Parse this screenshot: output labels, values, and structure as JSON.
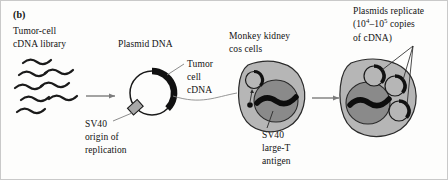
{
  "figure": {
    "panel_letter": "(b)",
    "background_color": "#fdfdfc",
    "border_color": "#c9c9c9",
    "ink_color": "#121212"
  },
  "labels": {
    "cdna_library_line1": "Tumor-cell",
    "cdna_library_line2": "cDNA library",
    "plasmid_dna": "Plasmid DNA",
    "tumor_cdna_line1": "Tumor",
    "tumor_cdna_line2": "cell",
    "tumor_cdna_line3": "cDNA",
    "sv40_origin_line1": "SV40",
    "sv40_origin_line2": "origin of",
    "sv40_origin_line3": "replication",
    "cos_cells_line1": "Monkey kidney",
    "cos_cells_line2": "cos cells",
    "large_t_line1": "SV40",
    "large_t_line2": "large-T",
    "large_t_line3": "antigen",
    "replicate_line1": "Plasmids replicate",
    "replicate_line2_pre": "(10",
    "replicate_line2_sup1": "4",
    "replicate_line2_mid": "–10",
    "replicate_line2_sup2": "5",
    "replicate_line2_post": " copies",
    "replicate_line3": "of cDNA)"
  },
  "colors": {
    "cytoplasm": "#b6b6b6",
    "nucleus": "#8a8a8a",
    "plasmid_insert": "#111111",
    "origin_box": "#a8a8a8",
    "arrow": "#7c7c7c",
    "stroke": "#1a1a1a",
    "leader": "#888888"
  },
  "diagram": {
    "type": "biology-process-flow",
    "stages": [
      {
        "name": "tumor-cell-cdna-library",
        "element": "wavy cDNA strands",
        "count": 8
      },
      {
        "name": "plasmid-dna",
        "element": "circular plasmid with cDNA insert and SV40 origin"
      },
      {
        "name": "monkey-kidney-cos-cell",
        "element": "cell with nucleus, large-T antigen, one plasmid"
      },
      {
        "name": "replicated-plasmids-cell",
        "element": "cell with nucleus and three plasmid copies"
      }
    ],
    "arrows": [
      {
        "from": "cdna-library",
        "to": "plasmid-dna"
      },
      {
        "from": "plasmid-dna",
        "to": "cos-cell"
      },
      {
        "from": "cos-cell",
        "to": "replicated-cell"
      }
    ]
  }
}
